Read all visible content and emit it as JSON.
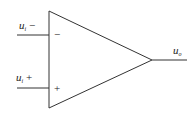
{
  "diagram": {
    "type": "op-amp",
    "inputs": [
      {
        "name": "u",
        "sub": "i",
        "sign": "−",
        "pin_mark": "−"
      },
      {
        "name": "u",
        "sub": "i",
        "sign": "+",
        "pin_mark": "+"
      }
    ],
    "output": {
      "name": "u",
      "sub": "o"
    },
    "colors": {
      "stroke": "#333333",
      "background": "#ffffff"
    }
  }
}
